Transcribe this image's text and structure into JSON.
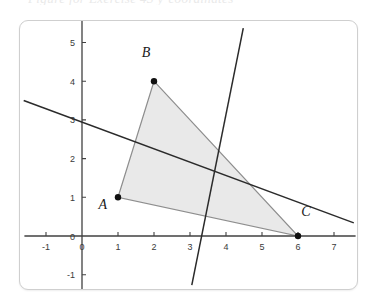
{
  "top_clipped_text": "Figure for Exercise 43 y-coordinates",
  "card": {
    "background": "#ffffff",
    "border_color": "#cfcfcf"
  },
  "chart_data": {
    "type": "scatter",
    "title": "",
    "subtitle": "",
    "xlabel": "",
    "ylabel": "",
    "xlim": [
      -1.6,
      7.6
    ],
    "ylim": [
      -1.6,
      5.6
    ],
    "grid": false,
    "legend": "none",
    "x_ticks": [
      -1,
      0,
      1,
      2,
      3,
      4,
      5,
      6,
      7
    ],
    "x_tick_labels": [
      "-1",
      "0",
      "1",
      "2",
      "3",
      "4",
      "5",
      "6",
      "7"
    ],
    "y_ticks": [
      -1,
      0,
      1,
      2,
      3,
      4,
      5
    ],
    "y_tick_labels": [
      "-1",
      "0",
      "1",
      "2",
      "3",
      "4",
      "5"
    ],
    "axis_color": "#404040",
    "points": [
      {
        "label": "A",
        "x": 1,
        "y": 1,
        "label_dx": -0.42,
        "label_dy": -0.3
      },
      {
        "label": "B",
        "x": 2,
        "y": 4,
        "label_dx": -0.22,
        "label_dy": 0.62
      },
      {
        "label": "C",
        "x": 6,
        "y": 0,
        "label_dx": 0.22,
        "label_dy": 0.52
      }
    ],
    "polygons": [
      {
        "name": "triangle-ABC",
        "vertices": [
          [
            1,
            1
          ],
          [
            2,
            4
          ],
          [
            6,
            0
          ]
        ],
        "fill": "#e9e9e9",
        "stroke": "#8e8e8e"
      }
    ],
    "lines": [
      {
        "name": "shallow-descending-line",
        "x1": -1.62,
        "y1": 3.5,
        "x2": 7.55,
        "y2": 0.34,
        "stroke": "#2b2b2b",
        "slope": -0.345,
        "y_intercept": 2.94
      },
      {
        "name": "steep-descending-line",
        "x1": 4.48,
        "y1": 5.37,
        "x2": 3.05,
        "y2": -1.27,
        "stroke": "#2b2b2b",
        "slope": -4.64,
        "y_intercept": 15.5
      }
    ]
  }
}
